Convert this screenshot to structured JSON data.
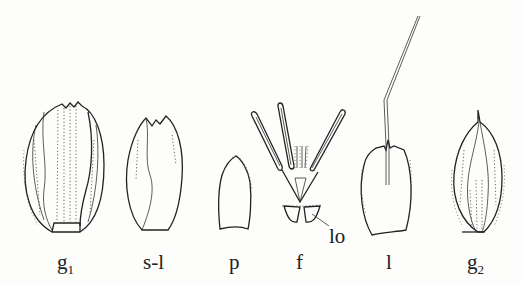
{
  "figure": {
    "parts": [
      {
        "id": "g1",
        "label": "g",
        "sub": "1",
        "description": "lower glume"
      },
      {
        "id": "s-l",
        "label": "s-l",
        "sub": "",
        "description": "sterile lemma"
      },
      {
        "id": "p",
        "label": "p",
        "sub": "",
        "description": "palea"
      },
      {
        "id": "f",
        "label": "f",
        "sub": "",
        "description": "flower"
      },
      {
        "id": "lo",
        "label": "lo",
        "sub": "",
        "description": "lodicules"
      },
      {
        "id": "l",
        "label": "l",
        "sub": "",
        "description": "lemma with awn"
      },
      {
        "id": "g2",
        "label": "g",
        "sub": "2",
        "description": "upper glume"
      }
    ]
  }
}
